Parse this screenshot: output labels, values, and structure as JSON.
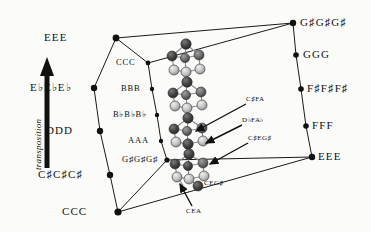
{
  "figure": {
    "background": "#fbfbf9",
    "line_color": "#1a1a1a",
    "node_color": "#111111",
    "sphere_dark": "#3a3a3a",
    "sphere_mid": "#6d6d6d",
    "sphere_light": "#c8c8c8"
  },
  "axis": {
    "label": "transposition",
    "direction": "upward"
  },
  "outer_left_column": [
    {
      "label": "EEE",
      "x": 116,
      "y": 38
    },
    {
      "label": "E♭E♭E♭",
      "x": 94,
      "y": 88
    },
    {
      "label": "DDD",
      "x": 100,
      "y": 131
    },
    {
      "label": "C♯C♯C♯",
      "x": 110,
      "y": 175
    },
    {
      "label": "CCC",
      "x": 118,
      "y": 212
    }
  ],
  "inner_left_column": [
    {
      "label": "CCC",
      "x": 148,
      "y": 63
    },
    {
      "label": "BBB",
      "x": 152,
      "y": 89
    },
    {
      "label": "B♭B♭B♭",
      "x": 157,
      "y": 115
    },
    {
      "label": "AAA",
      "x": 161,
      "y": 141
    },
    {
      "label": "G♯G♯G♯",
      "x": 167,
      "y": 160
    }
  ],
  "right_column": [
    {
      "label": "G♯G♯G♯",
      "x": 293,
      "y": 23
    },
    {
      "label": "GGG",
      "x": 296,
      "y": 55
    },
    {
      "label": "F♯F♯F♯",
      "x": 301,
      "y": 89
    },
    {
      "label": "FFF",
      "x": 306,
      "y": 126
    },
    {
      "label": "EEE",
      "x": 312,
      "y": 157
    }
  ],
  "chord_annotations": [
    {
      "label": "C♯FA",
      "text_x": 248,
      "text_y": 101
    },
    {
      "label": "D♭FA♭",
      "text_x": 244,
      "text_y": 122
    },
    {
      "label": "C♯EG♯",
      "text_x": 250,
      "text_y": 140
    },
    {
      "label": "CEG♯",
      "text_x": 206,
      "text_y": 175
    },
    {
      "label": "CEA",
      "text_x": 188,
      "text_y": 210
    }
  ]
}
